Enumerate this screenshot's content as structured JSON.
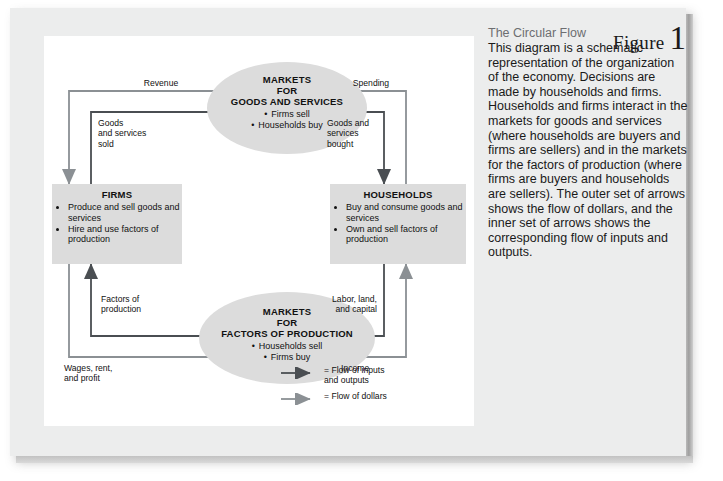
{
  "figure": {
    "label": "Figure",
    "number": "1"
  },
  "description": {
    "title": "The Circular Flow",
    "body": "This diagram is a schematic representation of the organization of the economy. Decisions are made by households and firms. Households and firms interact in the markets for goods and services (where households are buyers and firms are sellers) and in the markets for the factors of production (where firms are buyers and households are sellers). The outer set of arrows shows the flow of dollars, and the inner set of arrows shows the corresponding flow of inputs and outputs."
  },
  "diagram": {
    "nodes": {
      "markets_goods": {
        "title": "MARKETS\nFOR\nGOODS AND SERVICES",
        "items": [
          "Firms sell",
          "Households buy"
        ]
      },
      "firms": {
        "title": "FIRMS",
        "items": [
          "Produce and sell goods and services",
          "Hire and use factors of production"
        ]
      },
      "households": {
        "title": "HOUSEHOLDS",
        "items": [
          "Buy and consume goods and services",
          "Own and sell factors of production"
        ]
      },
      "markets_factors": {
        "title": "MARKETS\nFOR\nFACTORS OF PRODUCTION",
        "items": [
          "Households sell",
          "Firms buy"
        ]
      }
    },
    "flow_labels": {
      "revenue": "Revenue",
      "goods_services_sold": "Goods\nand services\nsold",
      "spending": "Spending",
      "goods_services_bought": "Goods and\nservices\nbought",
      "factors_of_production": "Factors of\nproduction",
      "wages_rent_profit": "Wages, rent,\nand profit",
      "labor_land_capital": "Labor, land,\nand capital",
      "income": "Income"
    },
    "legend": [
      {
        "icon": "dark-arrow-icon",
        "text": "=  Flow of inputs\n    and outputs"
      },
      {
        "icon": "light-arrow-icon",
        "text": "=  Flow of dollars"
      }
    ]
  },
  "colors": {
    "node_fill": "#dcdcdc",
    "dark_arrow": "#4a4e52",
    "light_arrow": "#8b9094",
    "frame": "#eceded",
    "title_gray": "#6d6e71"
  }
}
